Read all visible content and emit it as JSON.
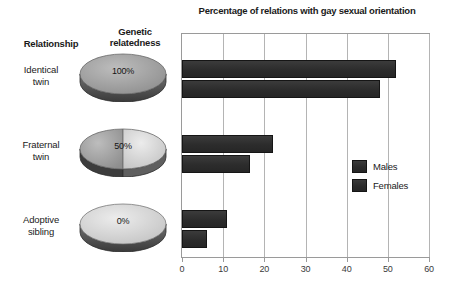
{
  "figure": {
    "left_panel": {
      "column_headers": [
        {
          "id": "relationship",
          "label": "Relationship"
        },
        {
          "id": "genetic-relatedness",
          "label": "Genetic\nrelatedness"
        }
      ],
      "rows": [
        {
          "relationship": "Identical\ntwin",
          "relatedness_label": "0%",
          "relatedness_pct": 100
        },
        {
          "relationship": "Fraternal\ntwin",
          "relatedness_label": "50%",
          "relatedness_pct": 50
        },
        {
          "relationship": "Adoptive\nsibling",
          "relatedness_label": "0%",
          "relatedness_pct": 0
        }
      ],
      "relatedness_values": [
        "100%",
        "50%",
        "0%"
      ]
    },
    "colors": {
      "bar_fill": "#2c2c2c",
      "bar_edge": "#151515",
      "disc_top_dark": "#9a9a9a",
      "disc_top_light": "#d4d4d4",
      "disc_side": "#4a4a4a",
      "gridline": "#b4b4b4",
      "frame": "#9a9a9a",
      "text": "#1a1a1a"
    }
  },
  "chart_data": {
    "type": "bar",
    "orientation": "horizontal",
    "title": "Percentage of relations with gay sexual orientation",
    "xlabel": "",
    "ylabel": "",
    "categories": [
      "Identical twin",
      "Fraternal twin",
      "Adoptive sibling"
    ],
    "series": [
      {
        "name": "Males",
        "values": [
          52,
          22,
          11
        ]
      },
      {
        "name": "Females",
        "values": [
          48,
          16.5,
          6
        ]
      }
    ],
    "xlim": [
      0,
      60
    ],
    "xticks": [
      0,
      10,
      20,
      30,
      40,
      50,
      60
    ],
    "xtick_labels": [
      "0",
      "10",
      "20",
      "30",
      "40",
      "50",
      "60"
    ],
    "grid": true,
    "grid_axis": "x",
    "legend": {
      "position": "right-middle",
      "entries": [
        "Males",
        "Females"
      ]
    }
  }
}
